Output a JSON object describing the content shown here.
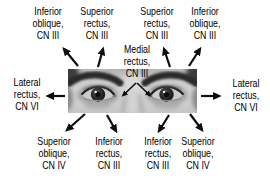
{
  "colors": {
    "background": "#ffffff",
    "text": "#000000",
    "arrow": "#0d0d0d"
  },
  "labels": {
    "top_left": [
      "Inferior",
      "oblique,",
      "CN III"
    ],
    "top_mid_left": [
      "Superior",
      "rectus,",
      "CN III"
    ],
    "top_mid_right": [
      "Superior",
      "rectus,",
      "CN III"
    ],
    "top_right": [
      "Inferior",
      "oblique,",
      "CN III"
    ],
    "medial": [
      "Medial",
      "rectus,",
      "CN III"
    ],
    "left": [
      "Lateral",
      "rectus,",
      "CN VI"
    ],
    "right": [
      "Lateral",
      "rectus,",
      "CN VI"
    ],
    "bottom_left": [
      "Superior",
      "oblique,",
      "CN IV"
    ],
    "bottom_mid_left": [
      "Inferior",
      "rectus,",
      "CN III"
    ],
    "bottom_mid_right": [
      "Inferior",
      "rectus,",
      "CN III"
    ],
    "bottom_right": [
      "Superior",
      "oblique,",
      "CN IV"
    ]
  }
}
